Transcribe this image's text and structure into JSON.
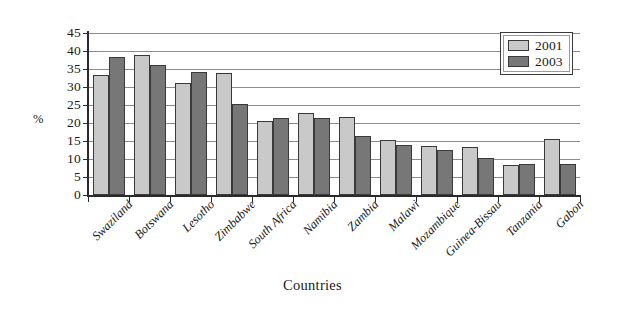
{
  "chart_data": {
    "type": "bar",
    "title": "",
    "subtitle": "",
    "xlabel": "Countries",
    "ylabel": "%",
    "categories": [
      "Swaziland",
      "Botswana",
      "Lesotho",
      "Zimbabwe",
      "South Africa",
      "Namibia",
      "Zambia",
      "Malawi",
      "Mozambique",
      "Guinea-Bissau",
      "Tanzania",
      "Gabon"
    ],
    "series": [
      {
        "name": "2001",
        "color": "#c9c9c9",
        "values": [
          33.3,
          39.0,
          31.1,
          34.0,
          20.5,
          22.8,
          21.8,
          15.3,
          13.5,
          13.3,
          8.2,
          15.6
        ]
      },
      {
        "name": "2003",
        "color": "#777777",
        "values": [
          38.2,
          36.0,
          34.2,
          25.2,
          21.3,
          21.3,
          16.4,
          14.0,
          12.5,
          10.4,
          8.6,
          8.6
        ]
      }
    ],
    "ylim": [
      0,
      45
    ],
    "ytick_values": [
      0,
      5,
      10,
      15,
      20,
      25,
      30,
      35,
      40,
      45
    ],
    "ytick_labels": [
      "0",
      "5",
      "10",
      "15",
      "20",
      "25",
      "30",
      "35",
      "40",
      "45"
    ],
    "grid": true,
    "grid_axis": "y",
    "legend_position": "top-right",
    "legend_entries": [
      "2001",
      "2003"
    ],
    "annotations": []
  }
}
